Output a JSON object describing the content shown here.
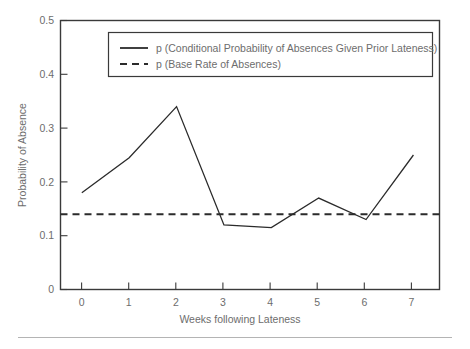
{
  "chart_data": {
    "type": "line",
    "title": "",
    "xlabel": "Weeks following Lateness",
    "ylabel": "Probability of Absence",
    "x": [
      0,
      1,
      2,
      3,
      4,
      5,
      6,
      7
    ],
    "xticklabels": [
      "0",
      "1",
      "2",
      "3",
      "4",
      "5",
      "6",
      "7"
    ],
    "yticks": [
      0,
      0.1,
      0.2,
      0.3,
      0.4,
      0.5
    ],
    "yticklabels": [
      "0",
      "0.1",
      "0.2",
      "0.3",
      "0.4",
      "0.5"
    ],
    "xlim": [
      -0.45,
      7.55
    ],
    "ylim": [
      0,
      0.5
    ],
    "grid": false,
    "legend_position": "upper-center-inside",
    "series": [
      {
        "name": "p (Conditional Probability of Absences Given Prior Lateness)",
        "style": "solid",
        "color": "#2b2b2b",
        "values": [
          0.18,
          0.245,
          0.34,
          0.12,
          0.115,
          0.17,
          0.13,
          0.25
        ]
      },
      {
        "name": "p (Base Rate of Absences)",
        "style": "dashed",
        "color": "#2b2b2b",
        "constant_value": 0.14,
        "values": [
          0.14,
          0.14,
          0.14,
          0.14,
          0.14,
          0.14,
          0.14,
          0.14
        ]
      }
    ],
    "legend_entries": [
      "p (Conditional Probability of Absences Given Prior Lateness)",
      "p (Base Rate of Absences)"
    ]
  },
  "axes": {
    "ylabel": "Probability of Absence",
    "xlabel": "Weeks following Lateness",
    "ytick_0": "0",
    "ytick_1": "0.1",
    "ytick_2": "0.2",
    "ytick_3": "0.3",
    "ytick_4": "0.4",
    "ytick_5": "0.5",
    "xtick_0": "0",
    "xtick_1": "1",
    "xtick_2": "2",
    "xtick_3": "3",
    "xtick_4": "4",
    "xtick_5": "5",
    "xtick_6": "6",
    "xtick_7": "7"
  },
  "legend": {
    "entry_conditional": "p (Conditional Probability of Absences Given Prior Lateness)",
    "entry_base_rate": "p (Base Rate of Absences)"
  },
  "colors": {
    "line": "#2b2b2b",
    "axis": "#3a3a3a",
    "text": "#6d6d6d",
    "background": "#ffffff",
    "rule": "#b4b4b4"
  }
}
